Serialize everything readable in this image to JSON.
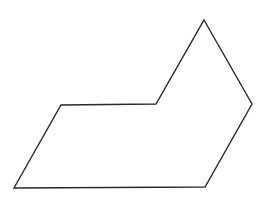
{
  "canvas": {
    "width": 266,
    "height": 203,
    "background": "#ffffff"
  },
  "shape": {
    "type": "polygon",
    "description": "hexagon",
    "stroke": "#2a2a2a",
    "stroke_width": 1.4,
    "fill": "none",
    "vertices": [
      [
        204,
        20
      ],
      [
        252,
        104
      ],
      [
        205,
        187
      ],
      [
        14,
        188
      ],
      [
        61,
        105
      ],
      [
        156,
        104
      ]
    ]
  }
}
